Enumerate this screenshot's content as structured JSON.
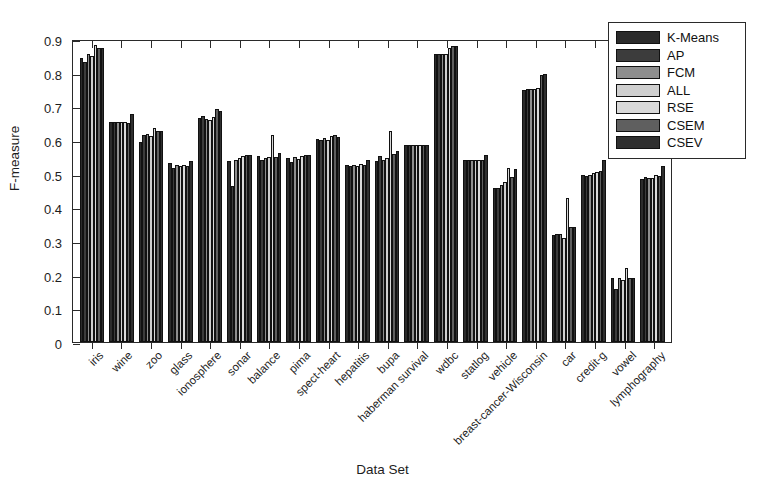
{
  "chart_data": {
    "type": "bar",
    "title": "",
    "xlabel": "Data Set",
    "ylabel": "F-measure",
    "ylim": [
      0,
      0.9
    ],
    "ytick_labels": [
      "0",
      "0.1",
      "0.2",
      "0.3",
      "0.4",
      "0.5",
      "0.6",
      "0.7",
      "0.8",
      "0.9"
    ],
    "ytick_values": [
      0,
      0.1,
      0.2,
      0.3,
      0.4,
      0.5,
      0.6,
      0.7,
      0.8,
      0.9
    ],
    "grid": false,
    "legend_position": "upper-right",
    "categories": [
      "iris",
      "wine",
      "zoo",
      "glass",
      "ionosphere",
      "sonar",
      "balance",
      "pima",
      "spect-heart",
      "hepatitis",
      "bupa",
      "haberman survival",
      "wdbc",
      "statlog",
      "vehicle",
      "breast-cancer-Wisconsin",
      "car",
      "credit-g",
      "vowel",
      "lymphography"
    ],
    "series": [
      {
        "name": "K-Means",
        "color": "#2b2b2b",
        "values": [
          0.85,
          0.657,
          0.598,
          0.535,
          0.67,
          0.54,
          0.555,
          0.55,
          0.608,
          0.53,
          0.54,
          0.59,
          0.86,
          0.545,
          0.462,
          0.755,
          0.32,
          0.5,
          0.19,
          0.487
        ]
      },
      {
        "name": "AP",
        "color": "#3c3c3c",
        "values": [
          0.838,
          0.657,
          0.62,
          0.52,
          0.675,
          0.465,
          0.545,
          0.538,
          0.603,
          0.525,
          0.555,
          0.59,
          0.862,
          0.545,
          0.462,
          0.757,
          0.322,
          0.497,
          0.16,
          0.492
        ]
      },
      {
        "name": "FCM",
        "color": "#8e8e8e",
        "values": [
          0.862,
          0.657,
          0.622,
          0.53,
          0.668,
          0.545,
          0.55,
          0.552,
          0.61,
          0.528,
          0.545,
          0.59,
          0.862,
          0.545,
          0.47,
          0.757,
          0.322,
          0.5,
          0.19,
          0.49
        ]
      },
      {
        "name": "ALL",
        "color": "#cfcfcf",
        "values": [
          0.855,
          0.657,
          0.615,
          0.525,
          0.665,
          0.55,
          0.553,
          0.548,
          0.605,
          0.525,
          0.55,
          0.59,
          0.862,
          0.545,
          0.478,
          0.758,
          0.312,
          0.505,
          0.185,
          0.49
        ]
      },
      {
        "name": "RSE",
        "color": "#d9d9d9",
        "values": [
          0.888,
          0.657,
          0.64,
          0.53,
          0.672,
          0.555,
          0.62,
          0.555,
          0.615,
          0.533,
          0.63,
          0.59,
          0.88,
          0.545,
          0.52,
          0.76,
          0.43,
          0.508,
          0.22,
          0.498
        ]
      },
      {
        "name": "CSEM",
        "color": "#5f5f5f",
        "values": [
          0.88,
          0.655,
          0.632,
          0.525,
          0.697,
          0.558,
          0.552,
          0.558,
          0.618,
          0.53,
          0.562,
          0.59,
          0.885,
          0.545,
          0.492,
          0.798,
          0.345,
          0.512,
          0.192,
          0.497
        ]
      },
      {
        "name": "CSEV",
        "color": "#2f2f2f",
        "values": [
          0.88,
          0.683,
          0.632,
          0.54,
          0.692,
          0.56,
          0.565,
          0.56,
          0.612,
          0.545,
          0.572,
          0.59,
          0.885,
          0.558,
          0.518,
          0.8,
          0.345,
          0.545,
          0.19,
          0.525
        ]
      }
    ]
  },
  "legend": {
    "items": [
      {
        "label": "K-Means"
      },
      {
        "label": "AP"
      },
      {
        "label": "FCM"
      },
      {
        "label": "ALL"
      },
      {
        "label": "RSE"
      },
      {
        "label": "CSEM"
      },
      {
        "label": "CSEV"
      }
    ]
  }
}
